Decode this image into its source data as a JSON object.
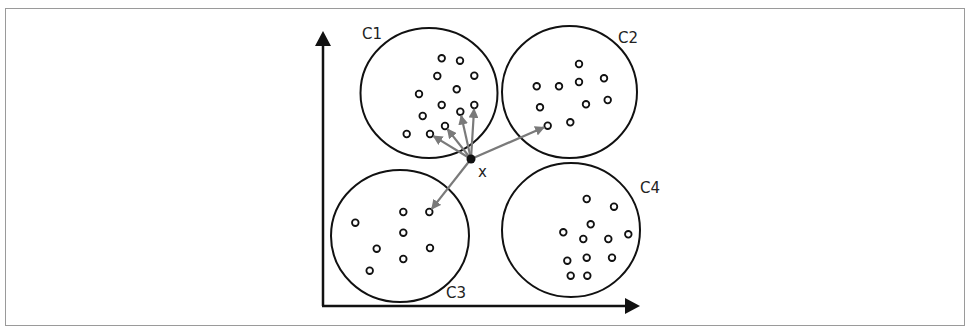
{
  "diagram": {
    "title": "",
    "query_point": {
      "label": "x"
    },
    "clusters": [
      {
        "id": "c1",
        "label": "C1",
        "points": [
          [
            441.7,
            58.3
          ],
          [
            460,
            60.7
          ],
          [
            437.3,
            76
          ],
          [
            474.3,
            75.7
          ],
          [
            419,
            94
          ],
          [
            456.7,
            89.3
          ],
          [
            441.7,
            105
          ],
          [
            460.3,
            111.7
          ],
          [
            474.3,
            105
          ],
          [
            422.7,
            116
          ],
          [
            445,
            126
          ],
          [
            406.7,
            134
          ],
          [
            430,
            134
          ]
        ]
      },
      {
        "id": "c2",
        "label": "C2",
        "points": [
          [
            579,
            64
          ],
          [
            536.7,
            86.3
          ],
          [
            559,
            86.3
          ],
          [
            579,
            82
          ],
          [
            604,
            78.3
          ],
          [
            540,
            107.3
          ],
          [
            586,
            104.3
          ],
          [
            607.7,
            100
          ],
          [
            547.7,
            125.7
          ],
          [
            570.3,
            122.3
          ]
        ]
      },
      {
        "id": "c3",
        "label": "C3",
        "points": [
          [
            355.3,
            222.7
          ],
          [
            403.3,
            212
          ],
          [
            429.3,
            212
          ],
          [
            403.3,
            232.7
          ],
          [
            376.7,
            248.7
          ],
          [
            430,
            248
          ],
          [
            403.3,
            259
          ],
          [
            369.7,
            270.7
          ]
        ]
      },
      {
        "id": "c4",
        "label": "C4",
        "points": [
          [
            586.7,
            199
          ],
          [
            614,
            206.7
          ],
          [
            590.7,
            224.3
          ],
          [
            563.3,
            232.3
          ],
          [
            583.3,
            239
          ],
          [
            608.3,
            239
          ],
          [
            628.3,
            234.3
          ],
          [
            567.3,
            260.7
          ],
          [
            586.7,
            257.7
          ],
          [
            612,
            257.7
          ],
          [
            570.7,
            275.7
          ],
          [
            587.3,
            275.7
          ]
        ]
      }
    ],
    "arrow_targets": [
      {
        "cluster": "C1",
        "point_index": 8
      },
      {
        "cluster": "C1",
        "point_index": 7
      },
      {
        "cluster": "C1",
        "point_index": 10
      },
      {
        "cluster": "C1",
        "point_index": 12
      },
      {
        "cluster": "C2",
        "point_index": 8
      },
      {
        "cluster": "C3",
        "point_index": 2
      }
    ],
    "colors": {
      "outline": "#111111",
      "arrow": "#7a7a7a",
      "frame": "#9a9a9a"
    }
  }
}
